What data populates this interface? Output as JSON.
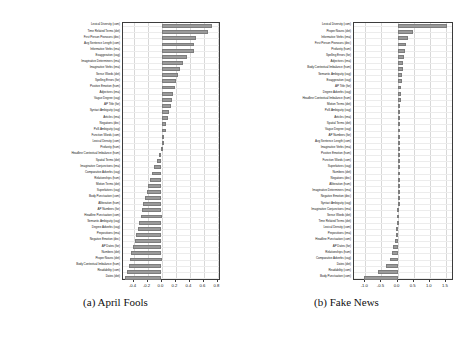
{
  "figure": {
    "background": "#ffffff",
    "bar_color": "#9a9a9a",
    "grid_color": "#d8d8d8"
  },
  "chart_data": [
    {
      "type": "bar",
      "orientation": "horizontal",
      "title": "",
      "caption": "(a) April Fools",
      "panel_label": "a",
      "xlabel": "",
      "ylabel": "",
      "xlim": [
        -0.55,
        0.85
      ],
      "xticks": [
        -0.4,
        -0.2,
        0.0,
        0.2,
        0.4,
        0.6,
        0.8
      ],
      "xticklabels": [
        "-0.4",
        "-0.2",
        "0.0",
        "0.2",
        "0.4",
        "0.6",
        "0.8"
      ],
      "grid": true,
      "legend": "none",
      "categories": [
        "Lexical Diversity (com)",
        "Time Related Terms (det)",
        "First Person Pronouns (dec)",
        "Avg Sentence Length (com)",
        "Informative Verbs (ima)",
        "Exaggeration (vag)",
        "Imaginative Determiners (ima)",
        "Imaginative Verbs (ima)",
        "Sense Words (det)",
        "Spelling Errors (for)",
        "Positive Emotion (hum)",
        "Adjectives (ima)",
        "Vague Degree (vag)",
        "AP Title (for)",
        "Syntact Ambiguity (vag)",
        "Articles (ima)",
        "Negations (dec)",
        "PoS Ambiguity (vag)",
        "Function Words (com)",
        "Lexical Density (com)",
        "Profanity (hum)",
        "Headline Contextual Imbalance (hum)",
        "Spatial Terms (det)",
        "Imaginative Conjunctions (ima)",
        "Comparative Adverbs (vag)",
        "Relationships (hum)",
        "Motion Terms (det)",
        "Superlatives (vag)",
        "Body Punctuation (com)",
        "Alliteration (hum)",
        "AP Numbers (for)",
        "Headline Punctuation (com)",
        "Semantic Ambiguity (vag)",
        "Degree Adverbs (vag)",
        "Prepositions (ima)",
        "Negative Emotion (dec)",
        "AP Dates (for)",
        "Numbers (det)",
        "Proper Nouns (det)",
        "Body Contextual Imbalance (hum)",
        "Readability (com)",
        "Dates (det)"
      ],
      "values": [
        0.72,
        0.66,
        0.49,
        0.47,
        0.46,
        0.37,
        0.3,
        0.27,
        0.24,
        0.21,
        0.19,
        0.17,
        0.15,
        0.13,
        0.1,
        0.09,
        0.07,
        0.06,
        0.015,
        0.004,
        -0.01,
        -0.04,
        -0.07,
        -0.11,
        -0.14,
        -0.17,
        -0.19,
        -0.21,
        -0.24,
        -0.26,
        -0.28,
        -0.3,
        -0.32,
        -0.34,
        -0.36,
        -0.38,
        -0.41,
        -0.43,
        -0.45,
        -0.47,
        -0.49,
        -0.52
      ]
    },
    {
      "type": "bar",
      "orientation": "horizontal",
      "title": "",
      "caption": "(b) Fake News",
      "panel_label": "b",
      "xlabel": "",
      "ylabel": "",
      "xlim": [
        -1.35,
        1.75
      ],
      "xticks": [
        -1.0,
        -0.5,
        0.0,
        0.5,
        1.0,
        1.5
      ],
      "xticklabels": [
        "-1.0",
        "-0.5",
        "0.0",
        "0.5",
        "1.0",
        "1.5"
      ],
      "grid": true,
      "legend": "none",
      "categories": [
        "Lexical Diversity (com)",
        "Proper Nouns (det)",
        "Informative Verbs (ima)",
        "First Person Pronouns (dec)",
        "Profanity (hum)",
        "Spelling Errors (for)",
        "Adjectives (ima)",
        "Body Contextual Imbalance (hum)",
        "Semantic Ambiguity (vag)",
        "Exaggeration (vag)",
        "AP Title (for)",
        "Degree Adverbs (vag)",
        "Headline Contextual Imbalance (hum)",
        "Motion Terms (det)",
        "PoS Ambiguity (vag)",
        "Articles (ima)",
        "Spatial Terms (det)",
        "Vague Degree (vag)",
        "AP Numbers (for)",
        "Avg Sentence Length (com)",
        "Imaginative Verbs (ima)",
        "Positive Emotion (hum)",
        "Function Words (com)",
        "Superlatives (vag)",
        "Numbers (det)",
        "Negations (dec)",
        "Alliteration (hum)",
        "Imaginative Determiners (ima)",
        "Negative Emotion (dec)",
        "Syntact Ambiguity (vag)",
        "Imaginative Conjunctions (ima)",
        "Sense Words (det)",
        "Time Related Terms (det)",
        "Lexical Density (com)",
        "Prepositions (ima)",
        "Headline Punctuation (com)",
        "AP Dates (for)",
        "Relationships (hum)",
        "Comparative Adverbs (vag)",
        "Dates (det)",
        "Readability (com)",
        "Body Punctuation (com)"
      ],
      "values": [
        1.52,
        0.47,
        0.32,
        0.26,
        0.23,
        0.2,
        0.18,
        0.16,
        0.14,
        0.13,
        0.12,
        0.11,
        0.1,
        0.09,
        0.085,
        0.08,
        0.07,
        0.065,
        0.06,
        0.05,
        0.045,
        0.04,
        0.035,
        0.03,
        0.025,
        0.02,
        0.015,
        0.01,
        0.005,
        0.002,
        -0.01,
        -0.02,
        -0.03,
        -0.04,
        -0.06,
        -0.09,
        -0.13,
        -0.17,
        -0.24,
        -0.36,
        -0.62,
        -1.05
      ]
    }
  ]
}
